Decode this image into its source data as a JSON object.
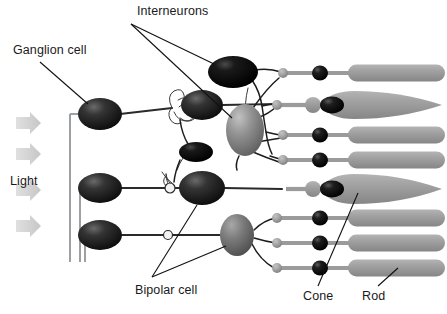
{
  "figure": {
    "background_color": "#ffffff"
  },
  "labels": {
    "interneurons": "Interneurons",
    "ganglion_cell": "Ganglion cell",
    "light": "Light",
    "bipolar_cell": "Bipolar cell",
    "cone": "Cone",
    "rod": "Rod"
  },
  "colors": {
    "ganglion_cell": "#1c1c1c",
    "bipolar_cell_dark": "#2b2b2b",
    "amacrine_cell": "#0d0d0d",
    "horizontal_cell": "#9a9a9a",
    "bipolar_cell_gray": "#7e7e7e",
    "photoreceptor": "#9c9c9c",
    "photoreceptor_nucleus": "#1a1a1a",
    "synapse_terminal": "#a6a6a6",
    "light_arrow": "#d2d2d2",
    "label_text": "#1a1a1a",
    "leader_line": "#111111"
  },
  "cells": {
    "ganglion": [
      {
        "name": "ganglion-cell-top",
        "cx": 100,
        "cy": 114,
        "rx": 22,
        "ry": 16
      },
      {
        "name": "ganglion-cell-middle",
        "cx": 100,
        "cy": 188,
        "rx": 22,
        "ry": 15
      },
      {
        "name": "ganglion-cell-bottom",
        "cx": 100,
        "cy": 235,
        "rx": 22,
        "ry": 15
      }
    ],
    "bipolar": [
      {
        "name": "bipolar-cell-upper",
        "cx": 202,
        "cy": 105,
        "rx": 21,
        "ry": 15,
        "tone": "dark"
      },
      {
        "name": "bipolar-cell-middle",
        "cx": 202,
        "cy": 188,
        "rx": 23,
        "ry": 17,
        "tone": "dark"
      },
      {
        "name": "bipolar-cell-lower",
        "cx": 237,
        "cy": 235,
        "rx": 17,
        "ry": 21,
        "tone": "gray"
      }
    ],
    "interneurons": [
      {
        "name": "amacrine-cell-top",
        "cx": 233,
        "cy": 72,
        "rx": 24,
        "ry": 16,
        "tone": "black"
      },
      {
        "name": "amacrine-cell-small",
        "cx": 196,
        "cy": 152,
        "rx": 17,
        "ry": 10,
        "tone": "black"
      },
      {
        "name": "horizontal-cell",
        "cx": 245,
        "cy": 130,
        "rx": 19,
        "ry": 26,
        "tone": "gray"
      }
    ],
    "photoreceptors": [
      {
        "name": "rod-1",
        "type": "rod",
        "y": 73,
        "terminal_x": 283,
        "nucleus_x": 320,
        "seg_x": 352,
        "seg_w": 92,
        "seg_h": 17
      },
      {
        "name": "cone-1",
        "type": "cone",
        "y": 105,
        "terminal_x": 277,
        "nucleus_x": 327,
        "seg_x": 345,
        "seg_w": 100,
        "seg_h": 26
      },
      {
        "name": "rod-2",
        "type": "rod",
        "y": 135,
        "terminal_x": 283,
        "nucleus_x": 320,
        "seg_x": 352,
        "seg_w": 92,
        "seg_h": 17
      },
      {
        "name": "rod-3",
        "type": "rod",
        "y": 160,
        "terminal_x": 283,
        "nucleus_x": 320,
        "seg_x": 352,
        "seg_w": 92,
        "seg_h": 17
      },
      {
        "name": "cone-2",
        "type": "cone",
        "y": 190,
        "terminal_x": 283,
        "nucleus_x": 327,
        "seg_x": 345,
        "seg_w": 100,
        "seg_h": 28
      },
      {
        "name": "rod-4",
        "type": "rod",
        "y": 218,
        "terminal_x": 277,
        "nucleus_x": 320,
        "seg_x": 352,
        "seg_w": 92,
        "seg_h": 17
      },
      {
        "name": "rod-5",
        "type": "rod",
        "y": 243,
        "terminal_x": 277,
        "nucleus_x": 320,
        "seg_x": 352,
        "seg_w": 92,
        "seg_h": 17
      },
      {
        "name": "rod-6",
        "type": "rod",
        "y": 268,
        "terminal_x": 277,
        "nucleus_x": 320,
        "seg_x": 352,
        "seg_w": 92,
        "seg_h": 17
      }
    ],
    "light_arrows": [
      {
        "name": "light-arrow-1",
        "x": 16,
        "y": 123
      },
      {
        "name": "light-arrow-2",
        "x": 16,
        "y": 154
      },
      {
        "name": "light-arrow-3",
        "x": 16,
        "y": 190
      },
      {
        "name": "light-arrow-4",
        "x": 16,
        "y": 226
      }
    ]
  },
  "label_positions": {
    "interneurons": {
      "x": 137,
      "y": 15
    },
    "ganglion_cell": {
      "x": 13,
      "y": 54
    },
    "light": {
      "x": 10,
      "y": 180
    },
    "bipolar_cell": {
      "x": 135,
      "y": 291
    },
    "cone": {
      "x": 303,
      "y": 298
    },
    "rod": {
      "x": 362,
      "y": 298
    }
  }
}
